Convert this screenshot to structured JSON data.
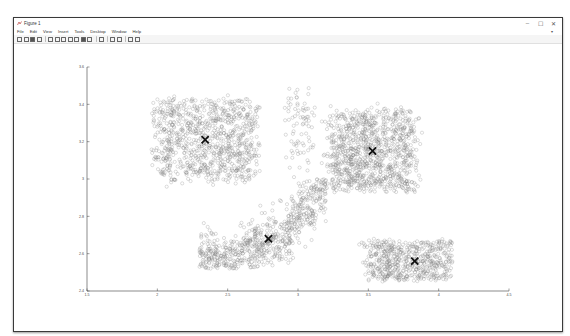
{
  "window": {
    "title": "Figure 1",
    "controls": {
      "minimize": "–",
      "maximize": "☐",
      "close": "✕"
    }
  },
  "menubar": {
    "items": [
      "File",
      "Edit",
      "View",
      "Insert",
      "Tools",
      "Desktop",
      "Window",
      "Help"
    ],
    "dock_arrow": "▾"
  },
  "toolbar": {
    "icons": [
      "new-figure-icon",
      "open-file-icon",
      "save-icon",
      "print-icon",
      "separator",
      "edit-plot-icon",
      "zoom-in-icon",
      "zoom-out-icon",
      "pan-icon",
      "rotate-3d-icon",
      "data-cursor-icon",
      "brush-icon",
      "separator",
      "link-plot-icon",
      "separator",
      "colorbar-icon",
      "legend-icon",
      "separator",
      "hide-plot-tools-icon",
      "show-plot-tools-icon"
    ]
  },
  "colors": {
    "point_edge": "#7a7a7a",
    "centroid": "#111111",
    "axis": "#3c3c3c",
    "tick_label": "#4a4a4a"
  },
  "chart_data": {
    "type": "scatter",
    "title": "",
    "xlabel": "",
    "ylabel": "",
    "xlim": [
      1.5,
      4.5
    ],
    "ylim": [
      2.4,
      3.6
    ],
    "xticks": [
      "1.5",
      "2",
      "2.5",
      "3",
      "3.5",
      "4",
      "4.5"
    ],
    "yticks": [
      "2.4",
      "2.6",
      "2.8",
      "3",
      "3.2",
      "3.4",
      "3.6"
    ],
    "grid": false,
    "box": false,
    "legend": null,
    "marker": "open circle (data), x (centroids)",
    "series": [
      {
        "name": "cluster-1 (top-left)",
        "center": [
          2.34,
          3.21
        ],
        "spread": [
          0.27,
          0.14
        ],
        "count": 900,
        "extent": {
          "x": [
            1.95,
            2.75
          ],
          "y": [
            2.95,
            3.45
          ]
        }
      },
      {
        "name": "cluster-2 (top-right)",
        "center": [
          3.53,
          3.15
        ],
        "spread": [
          0.23,
          0.14
        ],
        "count": 1000,
        "extent": {
          "x": [
            3.15,
            3.95
          ],
          "y": [
            2.92,
            3.42
          ]
        }
      },
      {
        "name": "cluster-3 (bottom-middle, arc)",
        "center": [
          2.79,
          2.68
        ],
        "spread": [
          0.3,
          0.1
        ],
        "count": 700,
        "extent": {
          "x": [
            2.3,
            3.2
          ],
          "y": [
            2.52,
            3.0
          ]
        }
      },
      {
        "name": "cluster-4 (bottom-right)",
        "center": [
          3.83,
          2.56
        ],
        "spread": [
          0.25,
          0.07
        ],
        "count": 550,
        "extent": {
          "x": [
            3.35,
            4.1
          ],
          "y": [
            2.45,
            2.72
          ]
        }
      },
      {
        "name": "sparse-noise (center-top)",
        "center": [
          3.0,
          3.25
        ],
        "spread": [
          0.08,
          0.15
        ],
        "count": 80,
        "extent": {
          "x": [
            2.9,
            3.15
          ],
          "y": [
            2.95,
            3.5
          ]
        }
      }
    ],
    "centroids": [
      {
        "x": 2.34,
        "y": 3.21
      },
      {
        "x": 3.53,
        "y": 3.15
      },
      {
        "x": 2.79,
        "y": 2.68
      },
      {
        "x": 3.83,
        "y": 2.56
      }
    ]
  }
}
